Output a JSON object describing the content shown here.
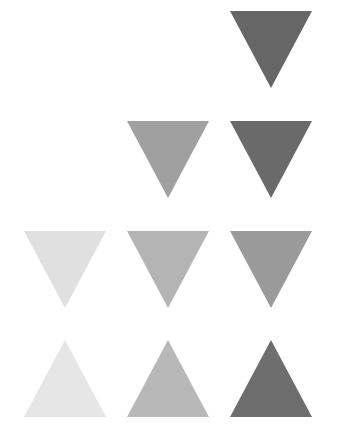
{
  "figure": {
    "background_color": "#ffffff",
    "width": 337,
    "height": 440
  },
  "chart_data": {
    "type": "heatmap",
    "subtitle": "",
    "xlabel": "",
    "ylabel": "",
    "grid": false,
    "legend": null,
    "annotations": [],
    "columns": [
      "col-1",
      "col-2",
      "col-3"
    ],
    "rows": [
      "row-1",
      "row-2",
      "row-3",
      "row-4"
    ],
    "column_x": [
      24,
      127,
      230
    ],
    "row_y": [
      11,
      121,
      231,
      340
    ],
    "cell_width": 83,
    "cell_height": 77,
    "column_pitch": 103,
    "row_pitch": 110,
    "marker_shape": "triangle",
    "values": [
      [
        null,
        null,
        0.6
      ],
      [
        null,
        0.37,
        0.58
      ],
      [
        0.12,
        0.29,
        0.4
      ],
      [
        0.1,
        0.28,
        0.57
      ]
    ],
    "colors": [
      [
        null,
        null,
        "#666666"
      ],
      [
        null,
        "#a0a0a0",
        "#6a6a6a"
      ],
      [
        "#e0e0e0",
        "#b4b4b4",
        "#9a9a9a"
      ],
      [
        "#e6e6e6",
        "#b8b8b8",
        "#6e6e6e"
      ]
    ],
    "orientations": [
      [
        null,
        null,
        "down"
      ],
      [
        null,
        "down",
        "down"
      ],
      [
        "down",
        "down",
        "down"
      ],
      [
        "up",
        "up",
        "up"
      ]
    ],
    "cells": [
      {
        "id": "tri-r1c3",
        "row": 0,
        "col": 2,
        "x": 230,
        "y": 11,
        "width": 83,
        "height": 77,
        "color": "#666666",
        "orientation": "down",
        "value": 0.6
      },
      {
        "id": "tri-r2c2",
        "row": 1,
        "col": 1,
        "x": 127,
        "y": 121,
        "width": 83,
        "height": 77,
        "color": "#a0a0a0",
        "orientation": "down",
        "value": 0.37
      },
      {
        "id": "tri-r2c3",
        "row": 1,
        "col": 2,
        "x": 230,
        "y": 121,
        "width": 83,
        "height": 77,
        "color": "#6a6a6a",
        "orientation": "down",
        "value": 0.58
      },
      {
        "id": "tri-r3c1",
        "row": 2,
        "col": 0,
        "x": 24,
        "y": 231,
        "width": 83,
        "height": 77,
        "color": "#e0e0e0",
        "orientation": "down",
        "value": 0.12
      },
      {
        "id": "tri-r3c2",
        "row": 2,
        "col": 1,
        "x": 127,
        "y": 231,
        "width": 83,
        "height": 77,
        "color": "#b4b4b4",
        "orientation": "down",
        "value": 0.29
      },
      {
        "id": "tri-r3c3",
        "row": 2,
        "col": 2,
        "x": 230,
        "y": 231,
        "width": 83,
        "height": 77,
        "color": "#9a9a9a",
        "orientation": "down",
        "value": 0.4
      },
      {
        "id": "tri-r4c1",
        "row": 3,
        "col": 0,
        "x": 24,
        "y": 340,
        "width": 83,
        "height": 77,
        "color": "#e6e6e6",
        "orientation": "up",
        "value": 0.1
      },
      {
        "id": "tri-r4c2",
        "row": 3,
        "col": 1,
        "x": 127,
        "y": 340,
        "width": 83,
        "height": 77,
        "color": "#b8b8b8",
        "orientation": "up",
        "value": 0.28
      },
      {
        "id": "tri-r4c3",
        "row": 3,
        "col": 2,
        "x": 230,
        "y": 340,
        "width": 83,
        "height": 77,
        "color": "#6e6e6e",
        "orientation": "up",
        "value": 0.57
      }
    ]
  }
}
